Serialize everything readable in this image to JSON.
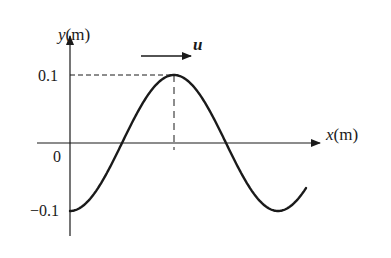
{
  "diagram": {
    "type": "transverse wave snapshot",
    "y_axis_label_var": "y",
    "y_axis_label_unit": "(m)",
    "x_axis_label_var": "x",
    "x_axis_label_unit": "(m)",
    "origin_label": "0",
    "tick_top_label": "0.1",
    "tick_bottom_label": "−0.1",
    "velocity_label": "u",
    "velocity_direction": "+x",
    "amplitude_m": 0.1,
    "curve": "y = -0.1 cos(kx), starts at trough at x=0, peak at half wavelength",
    "colors": {
      "line": "#1a1a1a",
      "background": "#ffffff"
    }
  }
}
